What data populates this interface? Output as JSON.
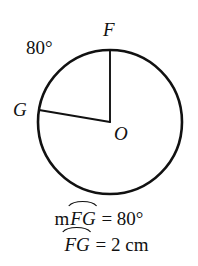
{
  "figure": {
    "type": "circle-with-central-angle",
    "stroke_color": "#111111",
    "background_color": "#ffffff",
    "circle": {
      "center_x": 110,
      "center_y": 122,
      "radius": 72
    },
    "center_point": {
      "name": "O",
      "label": "O",
      "x": 110,
      "y": 122
    },
    "points": [
      {
        "name": "F",
        "label": "F",
        "x": 110,
        "y": 50,
        "angle_deg": 90
      },
      {
        "name": "G",
        "label": "G",
        "x": 39,
        "y": 110,
        "angle_deg": 170
      }
    ],
    "radii": [
      {
        "from": "O",
        "to": "F"
      },
      {
        "from": "O",
        "to": "G"
      }
    ],
    "angle_annotation": {
      "label": "80°",
      "value": 80,
      "unit": "degrees"
    }
  },
  "caption": {
    "line1": {
      "prefix": "m",
      "arc_name": "FG",
      "operator": "=",
      "value": "80°"
    },
    "line2": {
      "arc_name": "FG",
      "operator": "=",
      "value": "2 cm"
    }
  }
}
